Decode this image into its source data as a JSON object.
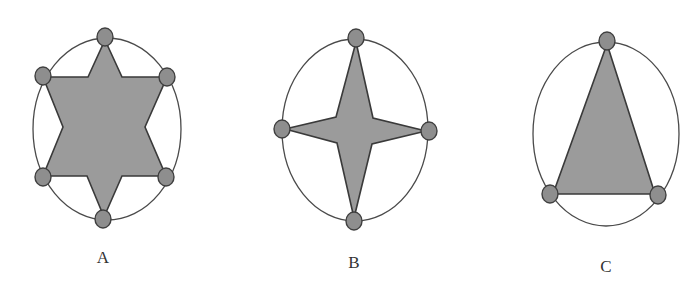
{
  "figures": [
    {
      "id": "A",
      "label": "A",
      "shape": "six-pointed-star",
      "ellipse": {
        "cx": 107,
        "cy": 129,
        "rx": 74,
        "ry": 91
      },
      "polygon": "105,40 122,77 167,77 145,127 166,176 122,176 104,217 87,176 43,176 63,127 43,77 88,77",
      "nodes": [
        [
          105,
          37
        ],
        [
          167,
          77
        ],
        [
          166,
          177
        ],
        [
          103,
          219
        ],
        [
          43,
          177
        ],
        [
          43,
          76
        ]
      ],
      "label_pos": [
        103,
        263
      ]
    },
    {
      "id": "B",
      "label": "B",
      "shape": "four-pointed-star",
      "ellipse": {
        "cx": 355,
        "cy": 130,
        "rx": 73,
        "ry": 91
      },
      "polygon": "356,42 373,118 426,131 372,144 354,218 337,143 285,129 336,117",
      "nodes": [
        [
          356,
          38
        ],
        [
          429,
          131
        ],
        [
          354,
          221
        ],
        [
          282,
          129
        ]
      ],
      "label_pos": [
        354,
        268
      ]
    },
    {
      "id": "C",
      "label": "C",
      "shape": "triangle",
      "ellipse": {
        "cx": 606,
        "cy": 134,
        "rx": 73,
        "ry": 92
      },
      "polygon": "607,44 655,194 553,194",
      "nodes": [
        [
          607,
          41
        ],
        [
          658,
          195
        ],
        [
          550,
          194
        ]
      ],
      "label_pos": [
        606,
        272
      ]
    }
  ],
  "colors": {
    "fill": "#9b9b9b",
    "node_fill": "#8e8e8e",
    "stroke": "#3a3a3a",
    "ellipse_stroke": "#4a4a4a",
    "label": "#333333"
  }
}
